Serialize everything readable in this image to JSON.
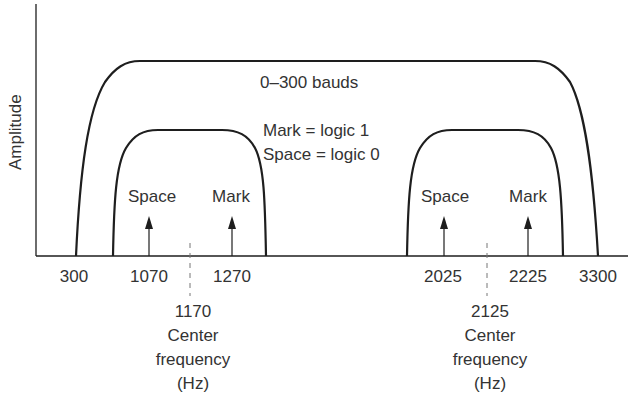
{
  "diagram": {
    "title": "",
    "y_axis_label": "Amplitude",
    "x_axis_unit": "Hz",
    "outer_band": {
      "label": "0–300 bauds",
      "from_hz": 300,
      "to_hz": 3300
    },
    "legend": {
      "mark": "Mark = logic 1",
      "space": "Space = logic 0"
    },
    "channels": [
      {
        "name": "low channel",
        "space_label": "Space",
        "mark_label": "Mark",
        "space_hz": "1070",
        "mark_hz": "1270",
        "center_hz": "1170",
        "center_line1": "Center",
        "center_line2": "frequency",
        "center_line3": "(Hz)"
      },
      {
        "name": "high channel",
        "space_label": "Space",
        "mark_label": "Mark",
        "space_hz": "2025",
        "mark_hz": "2225",
        "center_hz": "2125",
        "center_line1": "Center",
        "center_line2": "frequency",
        "center_line3": "(Hz)"
      }
    ],
    "x_ticks": [
      "300",
      "1070",
      "1270",
      "2025",
      "2225",
      "3300"
    ],
    "colors": {
      "line": "#1e1e1e",
      "text": "#333333",
      "background": "#ffffff"
    }
  }
}
